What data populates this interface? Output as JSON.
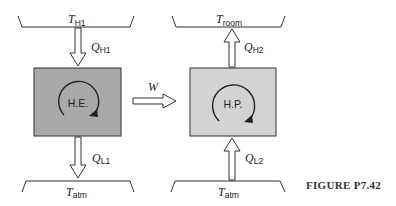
{
  "figure": {
    "caption": "FIGURE P7.42",
    "colors": {
      "heat_engine_fill": "#a9a9a9",
      "heat_pump_fill": "#d3d3d3",
      "stroke": "#333333"
    },
    "heat_engine": {
      "label": "H.E.",
      "source_reservoir": {
        "symbol": "T",
        "subscript": "H1"
      },
      "sink_reservoir": {
        "symbol": "T",
        "subscript": "atm"
      },
      "heat_in": {
        "symbol": "Q",
        "subscript": "H1"
      },
      "heat_out": {
        "symbol": "Q",
        "subscript": "L1"
      }
    },
    "work": {
      "symbol": "W"
    },
    "heat_pump": {
      "label": "H.P.",
      "source_reservoir": {
        "symbol": "T",
        "subscript": "atm"
      },
      "sink_reservoir": {
        "symbol": "T",
        "subscript": "room"
      },
      "heat_in": {
        "symbol": "Q",
        "subscript": "L2"
      },
      "heat_out": {
        "symbol": "Q",
        "subscript": "H2"
      }
    }
  }
}
